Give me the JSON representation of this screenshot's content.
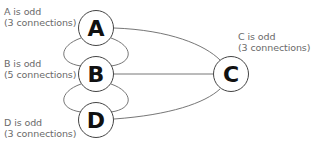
{
  "nodes": {
    "A": {
      "letter": "A",
      "line1": "A is odd",
      "line2": "(3 connections)"
    },
    "B": {
      "letter": "B",
      "line1": "B is odd",
      "line2": "(5 connections)"
    },
    "C": {
      "letter": "C",
      "line1": "C is odd",
      "line2": "(3 connections)"
    },
    "D": {
      "letter": "D",
      "line1": "D is odd",
      "line2": "(3 connections)"
    }
  },
  "edges": [
    [
      "A",
      "B"
    ],
    [
      "A",
      "B"
    ],
    [
      "B",
      "D"
    ],
    [
      "B",
      "D"
    ],
    [
      "A",
      "C"
    ],
    [
      "B",
      "C"
    ],
    [
      "D",
      "C"
    ]
  ],
  "colors": {
    "stroke": "#555555",
    "text": "#6a6a6a",
    "letter": "#111111"
  }
}
